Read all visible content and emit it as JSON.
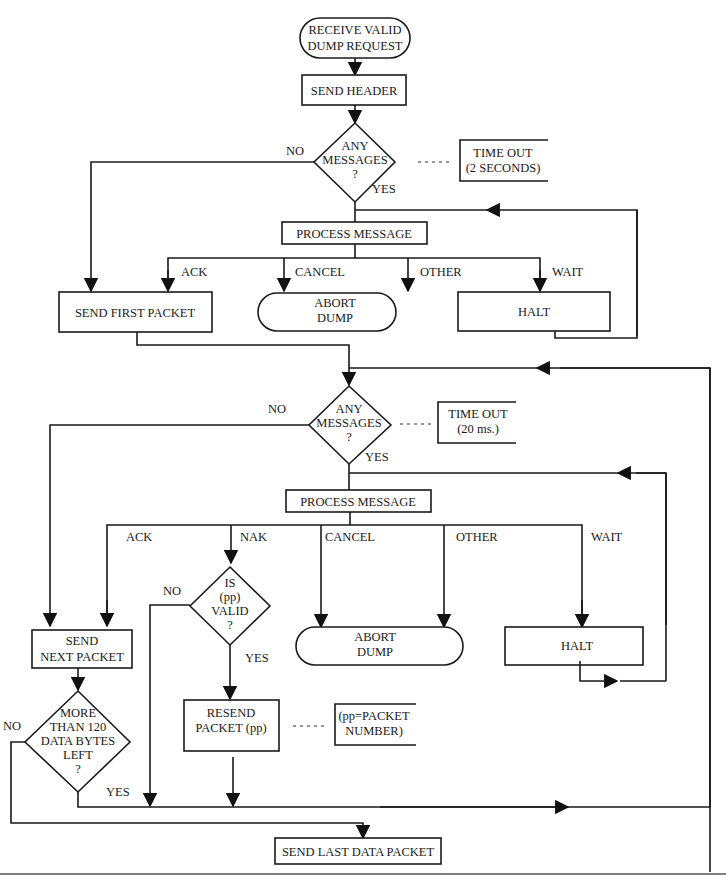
{
  "diagram": {
    "title": "",
    "nodes": {
      "start": {
        "type": "terminal",
        "lines": [
          "RECEIVE VALID",
          "DUMP REQUEST"
        ]
      },
      "send_header": {
        "type": "process",
        "lines": [
          "SEND HEADER"
        ]
      },
      "any_messages_1": {
        "type": "decision",
        "lines": [
          "ANY",
          "MESSAGES",
          "?"
        ]
      },
      "timeout_1": {
        "type": "annotation",
        "lines": [
          "TIME OUT",
          "(2 SECONDS)"
        ]
      },
      "process_message_1": {
        "type": "process",
        "lines": [
          "PROCESS MESSAGE"
        ]
      },
      "send_first_packet": {
        "type": "process",
        "lines": [
          "SEND FIRST PACKET"
        ]
      },
      "abort_dump_1": {
        "type": "terminal",
        "lines": [
          "ABORT",
          "DUMP"
        ]
      },
      "halt_1": {
        "type": "process",
        "lines": [
          "HALT"
        ]
      },
      "any_messages_2": {
        "type": "decision",
        "lines": [
          "ANY",
          "MESSAGES",
          "?"
        ]
      },
      "timeout_2": {
        "type": "annotation",
        "lines": [
          "TIME OUT",
          "(20 ms.)"
        ]
      },
      "process_message_2": {
        "type": "process",
        "lines": [
          "PROCESS MESSAGE"
        ]
      },
      "is_pp_valid": {
        "type": "decision",
        "lines": [
          "IS",
          "(pp)",
          "VALID",
          "?"
        ]
      },
      "abort_dump_2": {
        "type": "terminal",
        "lines": [
          "ABORT",
          "DUMP"
        ]
      },
      "halt_2": {
        "type": "process",
        "lines": [
          "HALT"
        ]
      },
      "send_next_packet": {
        "type": "process",
        "lines": [
          "SEND",
          "NEXT PACKET"
        ]
      },
      "resend_packet": {
        "type": "process",
        "lines": [
          "RESEND",
          "PACKET (pp)"
        ]
      },
      "pp_note": {
        "type": "annotation",
        "lines": [
          "(pp=PACKET",
          "NUMBER)"
        ]
      },
      "more_than_120": {
        "type": "decision",
        "lines": [
          "MORE",
          "THAN 120",
          "DATA BYTES",
          "LEFT",
          "?"
        ]
      },
      "send_last_packet": {
        "type": "process",
        "lines": [
          "SEND LAST DATA PACKET"
        ]
      }
    },
    "edge_labels": {
      "no_1": "NO",
      "yes_1": "YES",
      "ack_1": "ACK",
      "cancel_1": "CANCEL",
      "other_1": "OTHER",
      "wait_1": "WAIT",
      "no_2": "NO",
      "yes_2": "YES",
      "ack_2": "ACK",
      "nak_2": "NAK",
      "cancel_2": "CANCEL",
      "other_2": "OTHER",
      "wait_2": "WAIT",
      "no_pp": "NO",
      "yes_pp": "YES",
      "no_120": "NO",
      "yes_120": "YES"
    },
    "colors": {
      "stroke": "#1a1a1a",
      "background": "#ffffff"
    }
  }
}
